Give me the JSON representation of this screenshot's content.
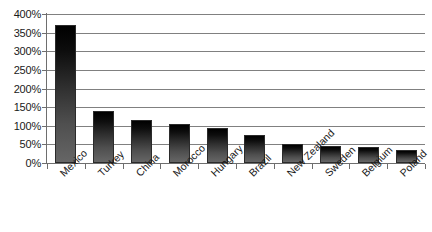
{
  "chart_data": {
    "type": "bar",
    "title": "",
    "xlabel": "",
    "ylabel": "",
    "ylim": [
      0,
      400
    ],
    "ytick_labels": [
      "400%",
      "350%",
      "300%",
      "250%",
      "200%",
      "150%",
      "100%",
      "50%",
      "0%"
    ],
    "ytick_values": [
      400,
      350,
      300,
      250,
      200,
      150,
      100,
      50,
      0
    ],
    "grid": true,
    "legend": false,
    "value_suffix": "%",
    "categories": [
      "Mexico",
      "Turkey",
      "China",
      "Morocco",
      "Hungary",
      "Brazil",
      "New Zealand",
      "Sweden",
      "Belgium",
      "Poland"
    ],
    "values": [
      370,
      140,
      115,
      105,
      93,
      75,
      52,
      47,
      43,
      35
    ],
    "bar_color_top": "#000000",
    "bar_color_bottom": "#666666",
    "gridline_color": "#808080",
    "axis_color": "#6e6e6e",
    "background_color": "#ffffff"
  }
}
